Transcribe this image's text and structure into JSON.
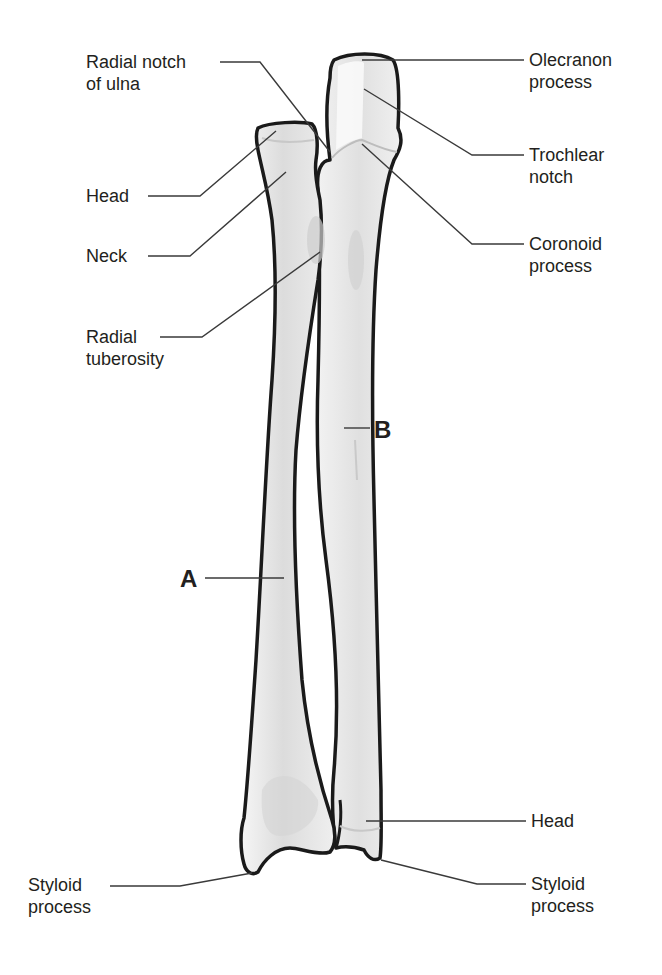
{
  "figure": {
    "colors": {
      "outline": "#1a1a1a",
      "leader": "#3a3a3a",
      "bone_fill": "#ececec",
      "bone_shade": "#d6d6d6",
      "bone_highlight": "#f8f8f8",
      "text": "#231f20"
    }
  },
  "bones": {
    "radius": {
      "letter": "A"
    },
    "ulna": {
      "letter": "B"
    }
  },
  "labels": {
    "radial_notch": {
      "line1": "Radial notch",
      "line2": "of ulna"
    },
    "radius_head": {
      "line1": "Head"
    },
    "neck": {
      "line1": "Neck"
    },
    "radial_tuberosity": {
      "line1": "Radial",
      "line2": "tuberosity"
    },
    "olecranon": {
      "line1": "Olecranon",
      "line2": "process"
    },
    "trochlear_notch": {
      "line1": "Trochlear",
      "line2": "notch"
    },
    "coronoid": {
      "line1": "Coronoid",
      "line2": "process"
    },
    "ulna_head": {
      "line1": "Head"
    },
    "radius_styloid": {
      "line1": "Styloid",
      "line2": "process"
    },
    "ulna_styloid": {
      "line1": "Styloid",
      "line2": "process"
    }
  }
}
